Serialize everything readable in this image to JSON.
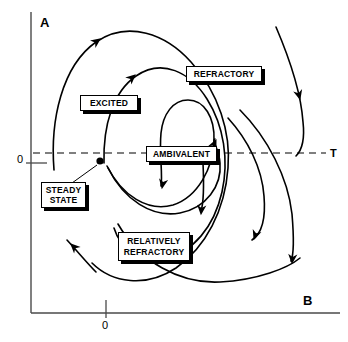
{
  "figure": {
    "type": "phase-plane-diagram",
    "title": "",
    "background_color": "#ffffff",
    "line_color": "#000000",
    "axis_color": "#000000",
    "dashed_line_color": "#000000"
  },
  "axes": {
    "vertical": {
      "label": "A",
      "label_x": 40,
      "label_y": 22,
      "origin_tick_label": "0",
      "origin_tick_label_x": 17,
      "origin_tick_label_y": 154,
      "axis_x": 31,
      "axis_top_y": 12,
      "axis_bottom_y": 313
    },
    "horizontal": {
      "label": "B",
      "label_x": 303,
      "label_y": 294,
      "origin_tick_label": "0",
      "origin_tick_label_x": 102,
      "origin_tick_label_y": 320,
      "axis_y": 313,
      "axis_left_x": 31,
      "axis_right_x": 340,
      "origin_tick_x": 106
    },
    "threshold": {
      "label": "T",
      "label_x": 330,
      "label_y": 148,
      "dash_y": 153,
      "dash_start_x": 33,
      "dash_end_x": 326
    }
  },
  "steady_state_point": {
    "x": 100,
    "y": 161,
    "radius": 3.6,
    "leader_line": {
      "x1": 97,
      "y1": 165,
      "x2": 72,
      "y2": 183
    }
  },
  "callouts": [
    {
      "name": "refractory",
      "lines": [
        "REFRACTORY"
      ],
      "x": 186,
      "y": 66,
      "width": 76,
      "height": 16
    },
    {
      "name": "excited",
      "lines": [
        "EXCITED"
      ],
      "x": 80,
      "y": 95,
      "width": 58,
      "height": 16
    },
    {
      "name": "ambivalent",
      "lines": [
        "AMBIVALENT"
      ],
      "x": 146,
      "y": 146,
      "width": 71,
      "height": 16
    },
    {
      "name": "steady-state",
      "lines": [
        "STEADY",
        "STATE"
      ],
      "x": 41,
      "y": 182,
      "width": 45,
      "height": 26
    },
    {
      "name": "relatively-refractory",
      "lines": [
        "RELATIVELY",
        "REFRACTORY"
      ],
      "x": 118,
      "y": 232,
      "width": 72,
      "height": 29
    }
  ],
  "trajectories": [
    {
      "name": "incoming-top-right",
      "path": "M 276,27 C 288,55 301,93 303,122 C 305,140 302,150 296,156",
      "arrows": [
        {
          "x": 300,
          "y": 99,
          "angle": 75
        }
      ]
    },
    {
      "name": "incoming-bottom-left",
      "path": "M 96,272 C 88,264 78,252 67,240",
      "arrows": [
        {
          "x": 71,
          "y": 244,
          "angle": 225
        }
      ]
    },
    {
      "name": "outer-spiral",
      "path": "M 54,170 C 50,120 62,66 96,42 C 128,20 166,34 191,62 C 219,93 231,133 228,168 C 225,210 206,247 176,268 C 146,288 112,283 92,263",
      "arrows": [
        {
          "x": 100,
          "y": 39,
          "angle": -36
        }
      ]
    },
    {
      "name": "second-spiral",
      "path": "M 104,163 C 103,125 113,92 136,76 C 162,58 190,72 207,99 C 224,126 229,160 222,192 C 214,227 193,252 166,258 C 140,263 120,248 114,228",
      "arrows": [
        {
          "x": 135,
          "y": 75,
          "angle": -42
        }
      ]
    },
    {
      "name": "third-spiral",
      "path": "M 107,166 C 122,196 148,212 173,205 C 198,197 213,168 214,141 C 215,117 204,100 188,100 C 173,100 163,114 161,133 C 159,154 163,174 161,186",
      "arrows": [
        {
          "x": 162,
          "y": 188,
          "angle": 100
        }
      ]
    },
    {
      "name": "inner-spiral",
      "path": "M 108,168 C 124,200 152,218 180,213 C 206,208 222,186 220,163 C 219,148 211,140 215,139",
      "arrows": [
        {
          "x": 216,
          "y": 140,
          "angle": -65
        }
      ]
    },
    {
      "name": "outer-descending-right",
      "path": "M 228,118 C 248,140 262,168 264,196 C 266,220 261,234 252,240",
      "arrows": [
        {
          "x": 254,
          "y": 239,
          "angle": 110
        }
      ]
    },
    {
      "name": "outermost-descending-right",
      "path": "M 240,110 C 268,138 288,178 292,214 C 294,238 294,254 291,261",
      "arrows": [
        {
          "x": 292,
          "y": 263,
          "angle": 95
        }
      ]
    },
    {
      "name": "lower-sweep",
      "path": "M 118,224 C 140,262 180,284 220,282 C 258,280 288,268 300,258",
      "arrows": []
    },
    {
      "name": "ambivalent-down-arrow",
      "path": "M 203,163 C 204,185 204,202 201,211",
      "arrows": [
        {
          "x": 201,
          "y": 214,
          "angle": 95
        }
      ]
    }
  ]
}
